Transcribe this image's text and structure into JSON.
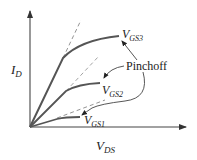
{
  "diagram": {
    "y_axis_label": {
      "main": "I",
      "sub": "D"
    },
    "x_axis_label": {
      "main": "V",
      "sub": "DS"
    },
    "curves": [
      {
        "name": "vgs1",
        "label_main": "V",
        "label_sub": "GS1"
      },
      {
        "name": "vgs2",
        "label_main": "V",
        "label_sub": "GS2"
      },
      {
        "name": "vgs3",
        "label_main": "V",
        "label_sub": "GS3"
      }
    ],
    "annotation": "Pinchoff",
    "colors": {
      "curve": "#555555",
      "axis": "#444444",
      "dash": "#888888",
      "text": "#222222"
    }
  }
}
